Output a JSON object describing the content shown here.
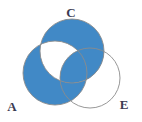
{
  "figure": {
    "type": "venn-diagram",
    "sets": [
      "A",
      "C",
      "E"
    ],
    "background_color": "#ffffff",
    "shade_color": "#4189c6",
    "outline_color": "#8b8b8b",
    "label_color": "#3b3b52"
  },
  "labels": {
    "a": "A",
    "c": "C",
    "e": "E"
  },
  "circles": {
    "a": {
      "cx": 55,
      "cy": 73,
      "r": 32
    },
    "c": {
      "cx": 72,
      "cy": 51,
      "r": 32
    },
    "e": {
      "cx": 90,
      "cy": 78,
      "r": 30
    }
  },
  "label_positions": {
    "a": {
      "x": 12,
      "y": 108
    },
    "c": {
      "x": 71,
      "y": 14
    },
    "e": {
      "x": 124,
      "y": 106
    }
  },
  "shaded_regions": [
    "A only",
    "A and E only",
    "A and C and E",
    "C and E only"
  ],
  "unshaded_regions": [
    "C only",
    "E only",
    "A and C only"
  ]
}
